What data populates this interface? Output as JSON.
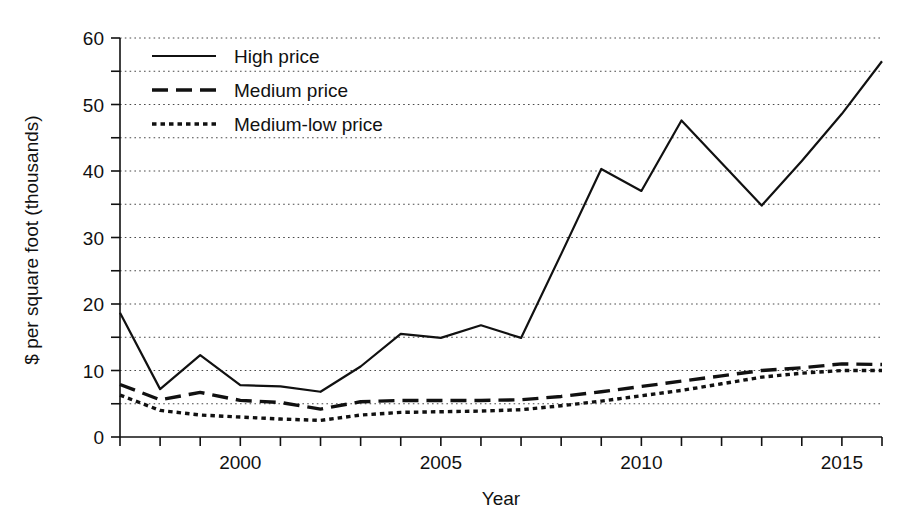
{
  "chart_data": {
    "type": "line",
    "title": "",
    "xlabel": "Year",
    "ylabel": "$ per square foot (thousands)",
    "xlim": [
      1997,
      2016
    ],
    "ylim": [
      0,
      60
    ],
    "grid": true,
    "grid_orientation": "horizontal",
    "grid_style": "dotted",
    "grid_values": [
      5,
      10,
      15,
      20,
      25,
      30,
      35,
      40,
      45,
      50,
      55,
      60
    ],
    "legend_position": "top-left",
    "y_ticks_major": [
      0,
      10,
      20,
      30,
      40,
      50,
      60
    ],
    "y_ticks_minor": [
      5,
      15,
      25,
      35,
      45,
      55
    ],
    "y_tick_labels": [
      "0",
      "10",
      "20",
      "30",
      "40",
      "50",
      "60"
    ],
    "x_ticks_major": [
      2000,
      2005,
      2010,
      2015
    ],
    "x_tick_labels": [
      "2000",
      "2005",
      "2010",
      "2015"
    ],
    "x_ticks_minor": [
      1997,
      1998,
      1999,
      2001,
      2002,
      2003,
      2004,
      2006,
      2007,
      2008,
      2009,
      2011,
      2012,
      2013,
      2014,
      2016
    ],
    "x": [
      1997,
      1998,
      1999,
      2000,
      2001,
      2002,
      2003,
      2004,
      2005,
      2006,
      2007,
      2008,
      2009,
      2010,
      2011,
      2012,
      2013,
      2014,
      2015,
      2016
    ],
    "series": [
      {
        "name": "High price",
        "style": "solid",
        "color": "#111111",
        "values": [
          18.7,
          7.2,
          12.3,
          7.8,
          7.6,
          6.8,
          10.6,
          15.5,
          14.9,
          16.8,
          14.9,
          27.5,
          40.3,
          37.0,
          47.6,
          41.2,
          34.8,
          41.5,
          48.6,
          56.5
        ]
      },
      {
        "name": "Medium price",
        "style": "dashed",
        "color": "#111111",
        "values": [
          7.9,
          5.6,
          6.7,
          5.5,
          5.2,
          4.2,
          5.3,
          5.5,
          5.5,
          5.5,
          5.6,
          6.1,
          6.8,
          7.6,
          8.4,
          9.2,
          10.0,
          10.4,
          11.0,
          10.9
        ]
      },
      {
        "name": "Medium-low price",
        "style": "dotted",
        "color": "#111111",
        "values": [
          6.3,
          4.0,
          3.3,
          3.0,
          2.7,
          2.5,
          3.3,
          3.7,
          3.8,
          3.9,
          4.1,
          4.7,
          5.4,
          6.2,
          7.0,
          8.0,
          9.0,
          9.6,
          10.0,
          10.0
        ]
      }
    ]
  },
  "legend": {
    "items": [
      {
        "label": "High price",
        "style": "solid"
      },
      {
        "label": "Medium price",
        "style": "dashed"
      },
      {
        "label": "Medium-low price",
        "style": "dotted"
      }
    ]
  },
  "axes": {
    "x_title": "Year",
    "y_title": "$ per square foot (thousands)"
  }
}
